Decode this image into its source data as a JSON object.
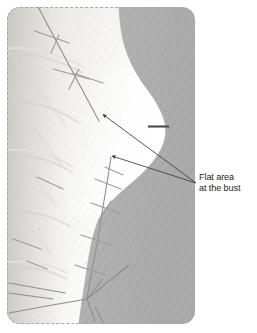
{
  "figure": {
    "kind": "annotated-photograph",
    "border_style": "dashed",
    "border_color": "#a9a9a9"
  },
  "photo": {
    "alt_name": "fitting-muslin-side-view",
    "palette": {
      "fabric_light": "#fbfbfa",
      "fabric_mid": "#efeeec",
      "fabric_shade": "#dcdbd8",
      "background_gray": "#b6b6b6",
      "background_gray_dark": "#a8a8a8",
      "seam_line": "#8d8d8d",
      "pin_line": "#9a9a9a",
      "dark_pin": "#4a4a4a"
    }
  },
  "annotations": {
    "leader_color": "#3b3b3b",
    "anchor": {
      "x": 196,
      "y": 183
    },
    "arrows": [
      {
        "name": "arrow-upper-bust",
        "tip_x": 101,
        "tip_y": 113
      },
      {
        "name": "arrow-lower-bust",
        "tip_x": 110,
        "tip_y": 155
      }
    ],
    "dark_mark": {
      "name": "dark-pin-mark",
      "x1": 148,
      "y1": 126,
      "x2": 169,
      "y2": 126
    }
  },
  "caption": {
    "line1": "Flat area",
    "line2": "at the bust",
    "color": "#231f20"
  }
}
